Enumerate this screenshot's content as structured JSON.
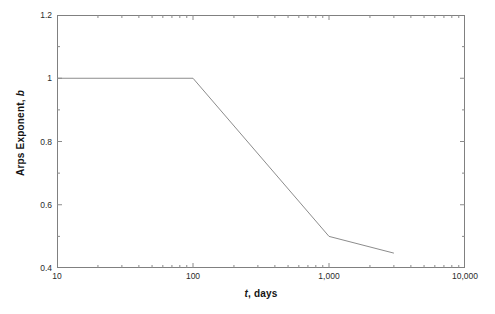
{
  "chart_data": {
    "type": "line",
    "title": "",
    "subtitle": "",
    "xlabel_plain": "t, days",
    "xlabel_var": "t",
    "xlabel_rest": ", days",
    "ylabel_plain": "Arps Exponent, b",
    "ylabel_prefix": "Arps Exponent, ",
    "ylabel_var": "b",
    "xscale": "log",
    "yscale": "linear",
    "xlim": [
      10,
      10000
    ],
    "ylim": [
      0.4,
      1.2
    ],
    "grid": false,
    "legend": "none",
    "x_major_ticks": [
      10,
      100,
      1000,
      10000
    ],
    "x_tick_labels": [
      "10",
      "100",
      "1,000",
      "10,000"
    ],
    "y_major_ticks": [
      0.4,
      0.6,
      0.8,
      1.0,
      1.2
    ],
    "y_tick_labels": [
      "0.4",
      "0.6",
      "0.8",
      "1",
      "1.2"
    ],
    "y_minor_ticks": [
      0.5,
      0.7,
      0.9,
      1.1
    ],
    "series": [
      {
        "name": "Arps b decline",
        "color": "#8c8c8c",
        "x": [
          10,
          100,
          1000,
          3000
        ],
        "y": [
          1.0,
          1.0,
          0.5,
          0.447
        ]
      }
    ],
    "annotations": []
  },
  "figure": {
    "background_color": "#ffffff",
    "frame_color": "#808080",
    "text_color": "#1a1a1a"
  }
}
